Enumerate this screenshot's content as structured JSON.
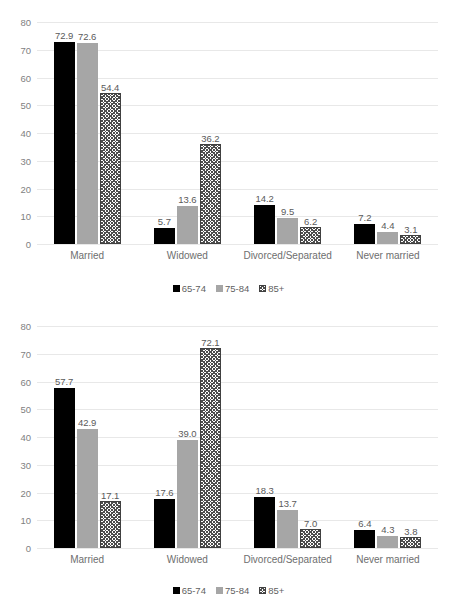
{
  "chart_data": [
    {
      "type": "bar",
      "title": "",
      "xlabel": "",
      "ylabel": "",
      "ylim": [
        0,
        80
      ],
      "yticks": [
        0,
        10,
        20,
        30,
        40,
        50,
        60,
        70,
        80
      ],
      "grid": true,
      "legend_position": "bottom",
      "categories": [
        "Married",
        "Widowed",
        "Divorced/Separated",
        "Never married"
      ],
      "series": [
        {
          "name": "65-74",
          "values": [
            72.9,
            5.7,
            14.2,
            7.2
          ],
          "labels": [
            "72.9",
            "5.7",
            "14.2",
            "7.2"
          ],
          "color": "#000000",
          "style": "solid"
        },
        {
          "name": "75-84",
          "values": [
            72.6,
            13.6,
            9.5,
            4.4
          ],
          "labels": [
            "72.6",
            "13.6",
            "9.5",
            "4.4"
          ],
          "color": "#a6a6a6",
          "style": "solid"
        },
        {
          "name": "85+",
          "values": [
            54.4,
            36.2,
            6.2,
            3.1
          ],
          "labels": [
            "54.4",
            "36.2",
            "6.2",
            "3.1"
          ],
          "color": "#ffffff",
          "style": "crosshatch"
        }
      ]
    },
    {
      "type": "bar",
      "title": "",
      "xlabel": "",
      "ylabel": "",
      "ylim": [
        0,
        80
      ],
      "yticks": [
        0,
        10,
        20,
        30,
        40,
        50,
        60,
        70,
        80
      ],
      "grid": true,
      "legend_position": "bottom",
      "categories": [
        "Married",
        "Widowed",
        "Divorced/Separated",
        "Never married"
      ],
      "series": [
        {
          "name": "65-74",
          "values": [
            57.7,
            17.6,
            18.3,
            6.4
          ],
          "labels": [
            "57.7",
            "17.6",
            "18.3",
            "6.4"
          ],
          "color": "#000000",
          "style": "solid"
        },
        {
          "name": "75-84",
          "values": [
            42.9,
            39.0,
            13.7,
            4.3
          ],
          "labels": [
            "42.9",
            "39.0",
            "13.7",
            "4.3"
          ],
          "color": "#a6a6a6",
          "style": "solid"
        },
        {
          "name": "85+",
          "values": [
            17.1,
            72.1,
            7.0,
            3.8
          ],
          "labels": [
            "17.1",
            "72.1",
            "7.0",
            "3.8"
          ],
          "color": "#ffffff",
          "style": "crosshatch"
        }
      ]
    }
  ]
}
